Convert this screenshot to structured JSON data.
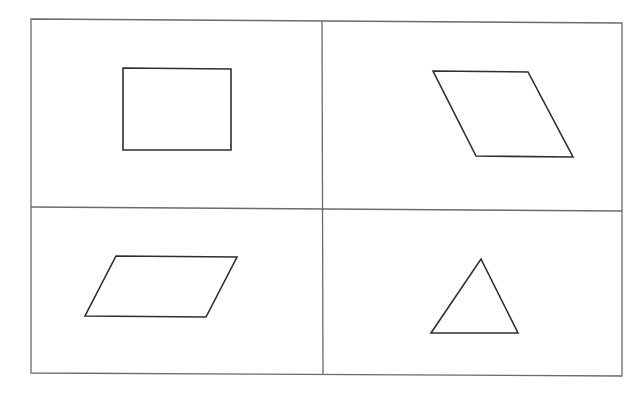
{
  "grid": {
    "rows": 2,
    "columns": 2,
    "line_color": "#6b6b6b",
    "cells": [
      {
        "position": "top-left",
        "shape": "square",
        "label": "Square",
        "points": "123,68 231,69 231,150 123,150"
      },
      {
        "position": "top-right",
        "shape": "rhombus",
        "label": "Rhombus",
        "points": "433,71 528,72 573,157 476,156"
      },
      {
        "position": "bottom-left",
        "shape": "parallelogram",
        "label": "Parallelogram",
        "points": "116,256 237,257 206,317 85,316"
      },
      {
        "position": "bottom-right",
        "shape": "triangle",
        "label": "Triangle",
        "points": "481,259 518,333 431,333"
      }
    ]
  },
  "stroke_color": "#2f2f2f"
}
